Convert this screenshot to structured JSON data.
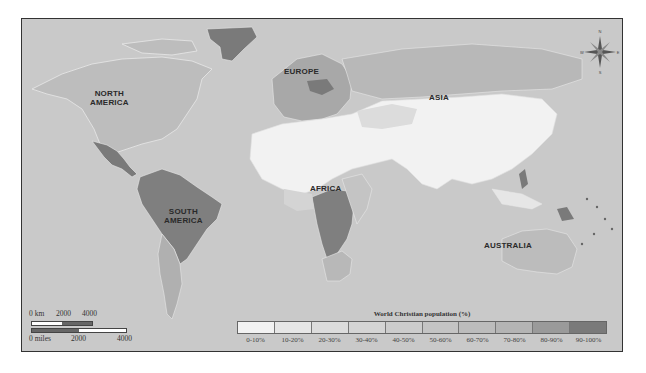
{
  "map": {
    "title": "World Christian population (%)",
    "background_color": "#c9c9c9",
    "region_labels": [
      {
        "id": "north-america",
        "text": "NORTH\nAMERICA"
      },
      {
        "id": "south-america",
        "text": "SOUTH\nAMERICA"
      },
      {
        "id": "europe",
        "text": "EUROPE"
      },
      {
        "id": "africa",
        "text": "AFRICA"
      },
      {
        "id": "asia",
        "text": "ASIA"
      },
      {
        "id": "australia",
        "text": "AUSTRALIA"
      }
    ],
    "labels": {
      "north_america_1": "NORTH",
      "north_america_2": "AMERICA",
      "south_america_1": "SOUTH",
      "south_america_2": "AMERICA",
      "europe": "EUROPE",
      "africa": "AFRICA",
      "asia": "ASIA",
      "australia": "AUSTRALIA"
    }
  },
  "legend": {
    "title": "World Christian population (%)",
    "categories": [
      {
        "label": "0-10%",
        "color": "#f2f2f2"
      },
      {
        "label": "10-20%",
        "color": "#e6e6e6"
      },
      {
        "label": "20-30%",
        "color": "#dcdcdc"
      },
      {
        "label": "30-40%",
        "color": "#d4d4d4"
      },
      {
        "label": "40-50%",
        "color": "#cccccc"
      },
      {
        "label": "50-60%",
        "color": "#c4c4c4"
      },
      {
        "label": "60-70%",
        "color": "#bcbcbc"
      },
      {
        "label": "70-80%",
        "color": "#b4b4b4"
      },
      {
        "label": "80-90%",
        "color": "#9a9a9a"
      },
      {
        "label": "90-100%",
        "color": "#7a7a7a"
      }
    ]
  },
  "scale_bar": {
    "km_labels": [
      "0 km",
      "2000",
      "4000"
    ],
    "miles_labels": [
      "0 miles",
      "2000",
      "4000"
    ]
  },
  "compass": {
    "north": "N",
    "south": "S",
    "east": "E",
    "west": "W"
  }
}
